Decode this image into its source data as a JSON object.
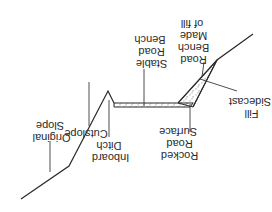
{
  "diagram": {
    "orientation": "rotated 180 degrees",
    "labels": {
      "original_slope": [
        "Original",
        "Slope"
      ],
      "cutslope": [
        "Cutslope"
      ],
      "inboard_ditch": [
        "Inboard",
        "Ditch"
      ],
      "stable_road_bench": [
        "Stable",
        "Road",
        "Bench"
      ],
      "road_bench_made_of_fill": [
        "Road",
        "Bench",
        "Made",
        "of fill"
      ],
      "rocked_road_surface": [
        "Rocked",
        "Road",
        "Surface"
      ],
      "sidecast_fill": [
        "Sidecast",
        "Fill"
      ]
    },
    "colors": {
      "line": "#2a2a2a",
      "background": "#ffffff",
      "fill_stipple": "#555555"
    }
  }
}
